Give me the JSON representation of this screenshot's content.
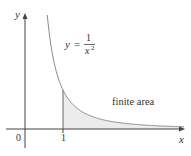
{
  "diagram": {
    "function_label": {
      "lhs": "y",
      "eq": "=",
      "numerator": "1",
      "denominator": "x",
      "exponent": "2"
    },
    "area_label": "finite area",
    "axes": {
      "x_label": "x",
      "y_label": "y",
      "origin_label": "0",
      "tick_label": "1"
    },
    "colors": {
      "axis": "#444444",
      "curve": "#8a8a8a",
      "fill": "#ececec",
      "text": "#333333"
    }
  }
}
